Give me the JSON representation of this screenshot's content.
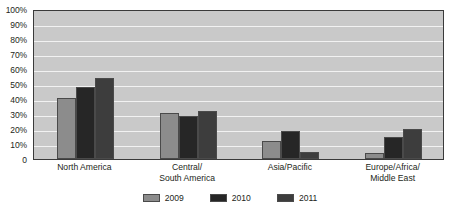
{
  "chart_data": {
    "type": "bar",
    "title": "",
    "xlabel": "",
    "ylabel": "",
    "ylim": [
      0,
      100
    ],
    "ytick_labels": [
      "100%",
      "90%",
      "80%",
      "70%",
      "60%",
      "50%",
      "40%",
      "30%",
      "20%",
      "10%",
      "0"
    ],
    "ytick_values": [
      100,
      90,
      80,
      70,
      60,
      50,
      40,
      30,
      20,
      10,
      0
    ],
    "grid": true,
    "legend_position": "bottom",
    "categories": [
      "North America",
      "Central/\nSouth America",
      "Asia/Pacific",
      "Europe/Africa/\nMiddle East"
    ],
    "series": [
      {
        "name": "2009",
        "color": "#8c8c8c",
        "values": [
          41,
          31,
          12,
          4
        ]
      },
      {
        "name": "2010",
        "color": "#262626",
        "values": [
          48,
          29,
          19,
          15
        ]
      },
      {
        "name": "2011",
        "color": "#3d3d3d",
        "values": [
          54,
          32,
          5,
          20
        ]
      }
    ]
  },
  "legend": {
    "items": [
      {
        "label": "2009",
        "color": "#8c8c8c"
      },
      {
        "label": "2010",
        "color": "#262626"
      },
      {
        "label": "2011",
        "color": "#3d3d3d"
      }
    ]
  },
  "colors": {
    "plot_background": "#c9c9c9",
    "gridline": "#f2f2f2",
    "axis_border": "#3a3a3a",
    "text": "#231f20"
  }
}
